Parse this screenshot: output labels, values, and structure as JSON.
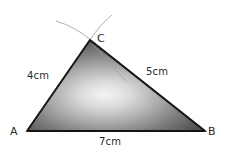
{
  "figure": {
    "background_color": "#ffffff",
    "vertices": {
      "A": {
        "label": "A",
        "x": 27,
        "y": 131
      },
      "B": {
        "label": "B",
        "x": 205,
        "y": 131
      },
      "C": {
        "label": "C",
        "x": 90,
        "y": 40
      }
    },
    "sides": [
      {
        "name": "AC",
        "label": "4cm",
        "length": 4,
        "unit": "cm"
      },
      {
        "name": "BC",
        "label": "5cm",
        "length": 5,
        "unit": "cm"
      },
      {
        "name": "AB",
        "label": "7cm",
        "length": 7,
        "unit": "cm"
      }
    ],
    "shading": {
      "highlight_color": "#f2f2f2",
      "mid_color": "#9a9a9a",
      "shadow_color": "#4f4f4f",
      "outline_color": "#1a1a1a"
    },
    "construction_arcs": {
      "count": 3,
      "color": "#a9a9a9",
      "description": "compass arcs crossing at C"
    }
  }
}
